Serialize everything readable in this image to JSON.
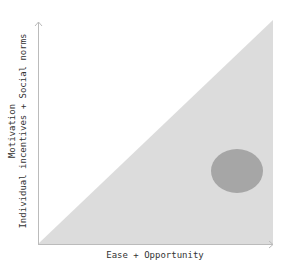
{
  "diagram": {
    "x_axis_label": "Ease + Opportunity",
    "y_axis_label_line1": "Motivation",
    "y_axis_label_line2": "Individual incentives + Social norms",
    "colors": {
      "region_fill": "#dcdcdc",
      "marker_fill": "#a6a6a6",
      "axis": "#bbbbbb",
      "text": "#333333"
    },
    "region": {
      "shape": "triangle",
      "points": [
        [
          38,
          244
        ],
        [
          273,
          20
        ],
        [
          273,
          244
        ]
      ]
    },
    "marker": {
      "shape": "ellipse",
      "cx": 237,
      "cy": 171,
      "rx": 26,
      "ry": 22
    }
  }
}
